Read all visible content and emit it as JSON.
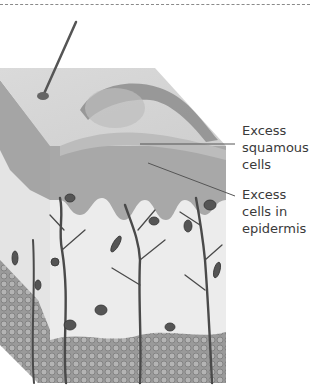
{
  "figure": {
    "colors": {
      "background": "#ffffff",
      "tissue_light": "#e6e6e6",
      "epidermis": "#a8a8a8",
      "fat": "#8c8c8c",
      "vessel": "#4a4a4a",
      "text": "#3a3a3a",
      "leader": "#555555"
    }
  },
  "labels": {
    "squamous": "Excess\nsquamous\ncells",
    "epidermis": "Excess\ncells in\nepidermis"
  }
}
